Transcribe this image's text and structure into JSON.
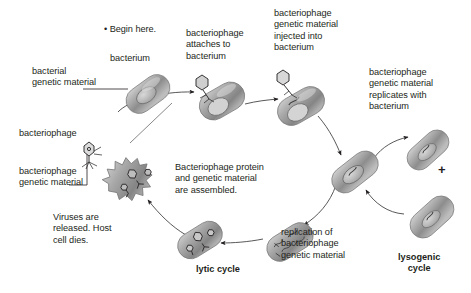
{
  "diagram": {
    "background_color": "#ffffff",
    "text_color": "#231f20",
    "cell_color": "#9a9a9a"
  },
  "labels": {
    "begin_here": "• Begin here.",
    "bacterium": "bacterium",
    "bacterial_genetic_material": "bacterial\ngenetic material",
    "attaches": "bacteriophage\nattaches to\nbacterium",
    "injected": "bacteriophage\ngenetic material\ninjected into\nbacterium",
    "replicates_with": "bacteriophage\ngenetic material\nreplicates with\nbacterium",
    "bacteriophage": "bacteriophage",
    "phage_genetic_material": "bacteriophage\ngenetic material",
    "viruses_released": "Viruses are\nreleased. Host\ncell dies.",
    "assembled": "Bacteriophage protein\nand genetic material\nare assembled.",
    "replication_of": "replication of\nbacteriophage\ngenetic material",
    "plus": "+"
  },
  "cycles": {
    "lytic": "lytic cycle",
    "lysogenic": "lysogenic\ncycle"
  },
  "icons": {
    "bacterium": "bacterium-icon",
    "phage": "bacteriophage-icon",
    "arrow": "arrow-icon",
    "bullet": "bullet-icon"
  }
}
